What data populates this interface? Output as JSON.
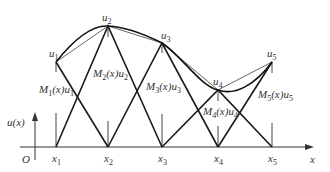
{
  "diagram": {
    "type": "finite-element-linear-shape-functions",
    "axis": {
      "origin_label": "O",
      "x_label": "x",
      "y_label": "u(x)"
    },
    "nodes": [
      {
        "x_label": "x",
        "x_sub": "1",
        "u_label": "u",
        "u_sub": "1",
        "shape_label": "M",
        "shape_sub": "1",
        "shape_text": "M1(x)u1"
      },
      {
        "x_label": "x",
        "x_sub": "2",
        "u_label": "u",
        "u_sub": "2",
        "shape_label": "M",
        "shape_sub": "2",
        "shape_text": "M2(x)u2"
      },
      {
        "x_label": "x",
        "x_sub": "3",
        "u_label": "u",
        "u_sub": "3",
        "shape_label": "M",
        "shape_sub": "3",
        "shape_text": "M3(x)u3"
      },
      {
        "x_label": "x",
        "x_sub": "4",
        "u_label": "u",
        "u_sub": "4",
        "shape_label": "M",
        "shape_sub": "4",
        "shape_text": "M4(x)u4"
      },
      {
        "x_label": "x",
        "x_sub": "5",
        "u_label": "u",
        "u_sub": "5",
        "shape_label": "M",
        "shape_sub": "5",
        "shape_text": "M5(x)u5"
      }
    ],
    "shape_suffix": "(x)u"
  }
}
